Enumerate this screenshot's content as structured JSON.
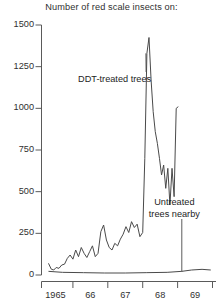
{
  "chart_data": {
    "type": "line",
    "title": "Number of red scale insects on:",
    "xlabel": "",
    "ylabel": "",
    "xlim": [
      1964.6,
      1969.6
    ],
    "ylim": [
      0,
      1500
    ],
    "grid": false,
    "legend_position": "inline-annotations",
    "y_ticks": [
      0,
      250,
      500,
      750,
      1000,
      1250,
      1500
    ],
    "y_tick_labels": [
      "0",
      "250",
      "500",
      "750",
      "1000",
      "1250",
      "1500"
    ],
    "x_ticks": [
      1965,
      1966,
      1967,
      1968,
      1969
    ],
    "x_tick_labels": [
      "1965",
      "66",
      "67",
      "68",
      "69"
    ],
    "x_minor_ticks": [
      1964.6,
      1965.5,
      1966.5,
      1967.5,
      1968.5,
      1969.5
    ],
    "annotations": [
      {
        "name": "ddt-treated-trees",
        "text": "DDT-treated trees",
        "x": 1966.05,
        "y": 1170,
        "pointer_to_x": 1967.62,
        "pointer_to_y": 1330
      },
      {
        "name": "untreated-trees-nearby",
        "text_line1": "Untreated",
        "text_line2": "trees nearby",
        "x": 1968.62,
        "y": 300,
        "pointer_to_x": 1968.62,
        "pointer_to_y": 20
      }
    ],
    "series": [
      {
        "name": "DDT-treated trees",
        "color": "#4a4a4a",
        "x": [
          1964.8,
          1964.88,
          1964.95,
          1965.02,
          1965.1,
          1965.18,
          1965.26,
          1965.34,
          1965.42,
          1965.5,
          1965.58,
          1965.66,
          1965.74,
          1965.82,
          1965.9,
          1965.98,
          1966.06,
          1966.14,
          1966.22,
          1966.3,
          1966.38,
          1966.46,
          1966.54,
          1966.62,
          1966.7,
          1966.78,
          1966.86,
          1966.94,
          1967.02,
          1967.1,
          1967.18,
          1967.26,
          1967.34,
          1967.42,
          1967.5,
          1967.56,
          1967.62,
          1967.68,
          1967.74,
          1967.8,
          1967.86,
          1967.92,
          1967.98,
          1968.04,
          1968.1,
          1968.16,
          1968.22,
          1968.28,
          1968.34,
          1968.4,
          1968.46,
          1968.52
        ],
        "y": [
          70,
          35,
          30,
          45,
          40,
          60,
          65,
          100,
          120,
          95,
          150,
          110,
          165,
          130,
          105,
          140,
          175,
          110,
          130,
          260,
          300,
          210,
          165,
          150,
          190,
          175,
          215,
          245,
          290,
          255,
          320,
          285,
          305,
          230,
          255,
          700,
          1330,
          1425,
          1170,
          980,
          860,
          790,
          700,
          600,
          660,
          520,
          640,
          420,
          640,
          470,
          1000,
          1010
        ]
      },
      {
        "name": "Untreated trees nearby",
        "color": "#4a4a4a",
        "x": [
          1964.8,
          1965.2,
          1965.8,
          1966.4,
          1967.0,
          1967.6,
          1968.2,
          1968.62,
          1968.9,
          1969.2,
          1969.45
        ],
        "y": [
          22,
          16,
          14,
          12,
          12,
          14,
          16,
          22,
          30,
          34,
          30
        ]
      }
    ]
  }
}
